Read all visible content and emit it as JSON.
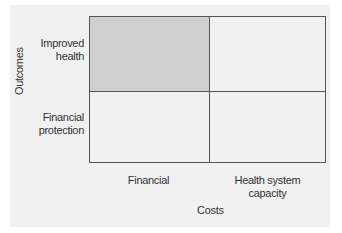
{
  "diagram": {
    "type": "2x2 matrix",
    "y_axis_label": "Outcomes",
    "x_axis_label": "Costs",
    "rows": [
      "Improved health",
      "Financial protection"
    ],
    "row_lines": [
      [
        "Improved",
        "health"
      ],
      [
        "Financial",
        "protection"
      ]
    ],
    "columns": [
      "Financial",
      "Health system capacity"
    ],
    "column_lines": [
      [
        "Financial"
      ],
      [
        "Health system",
        "capacity"
      ]
    ],
    "highlighted_cell": {
      "row": "Improved health",
      "column": "Financial"
    },
    "colors": {
      "background": "#f1f1f1",
      "highlight": "#cfcfcf",
      "border": "#555555",
      "text": "#333333"
    }
  }
}
